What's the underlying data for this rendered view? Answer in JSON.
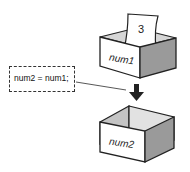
{
  "diagram": {
    "code_statement": "num2 = num1;",
    "box_top": {
      "label": "num1",
      "paper_value": "3"
    },
    "box_bottom": {
      "label": "num2"
    },
    "colors": {
      "outline": "#222222",
      "front_face": "#ffffff",
      "side_face": "#9a9a9a",
      "inner_back": "#d8d8d8",
      "inner_side": "#bdbdbd"
    }
  }
}
